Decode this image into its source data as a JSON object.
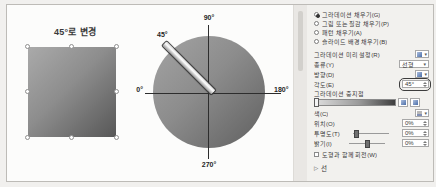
{
  "square": {
    "title": "45°로 변경"
  },
  "dial": {
    "top_label": "90°",
    "bottom_label": "270°",
    "left_label": "0°",
    "right_label": "180°",
    "angle_label": "45°"
  },
  "panel": {
    "fill_options": [
      {
        "label": "그라데이션 채우기(G)",
        "selected": true
      },
      {
        "label": "그림 또는 질감 채우기(P)",
        "selected": false
      },
      {
        "label": "패턴 채우기(A)",
        "selected": false
      },
      {
        "label": "슬라이드 배경 채우기(B)",
        "selected": false
      }
    ],
    "preset_label": "그라데이션 미리 설정(R)",
    "type_label": "종류(Y)",
    "type_value": "선형",
    "direction_label": "방향(D)",
    "angle_label": "각도(E)",
    "angle_value": "45°",
    "stops_label": "그라데이션 중지점",
    "color_label": "색(C)",
    "position_label": "위치(O)",
    "position_value": "0%",
    "transparency_label": "투명도(T)",
    "transparency_value": "0%",
    "brightness_label": "밝기(I)",
    "brightness_value": "0%",
    "rotate_with_shape_label": "도형과 함께 회전(W)",
    "line_section_label": "선"
  },
  "icons": {
    "caret_down": "▾",
    "collapsed_arrow": "▷"
  },
  "colors": {
    "gradient_light": "#aaaaaa",
    "gradient_dark": "#575757",
    "panel_bg": "#f2f1ee",
    "annotation_outline": "#3d3d3d"
  }
}
